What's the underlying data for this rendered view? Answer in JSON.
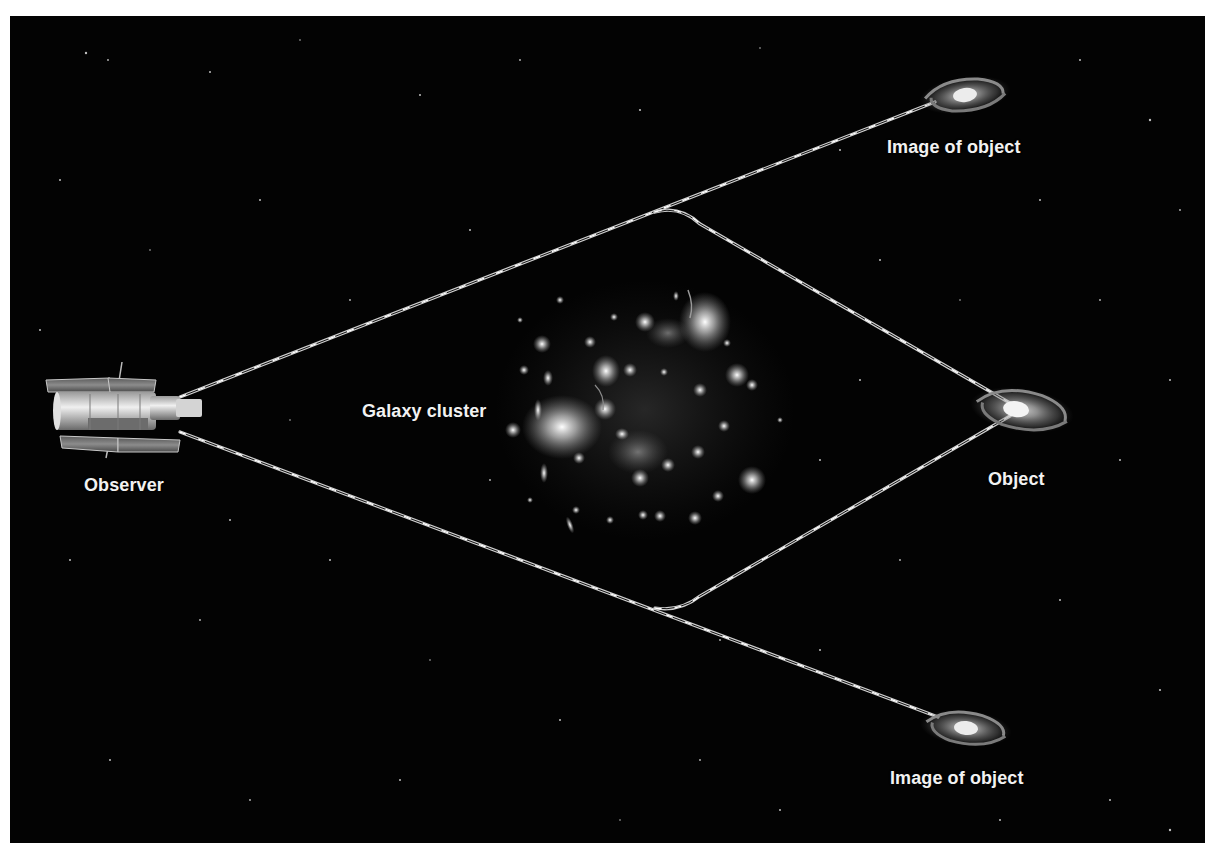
{
  "figure": {
    "background_color": "#030303",
    "line_color": "#e8e8e8",
    "label_color": "#f2f2f2"
  },
  "labels": {
    "observer": "Observer",
    "galaxy_cluster": "Galaxy cluster",
    "object": "Object",
    "image_top": "Image of object",
    "image_bottom": "Image of object"
  },
  "elements": {
    "observer_icon": "space-telescope-icon",
    "cluster_icon": "galaxy-cluster",
    "object_icon": "spiral-galaxy-icon",
    "image_icon": "spiral-galaxy-icon"
  },
  "geometry": {
    "observer": {
      "x": 120,
      "y": 410
    },
    "upper_bend": {
      "x": 655,
      "y": 212
    },
    "lower_bend": {
      "x": 655,
      "y": 608
    },
    "object": {
      "x": 1020,
      "y": 410
    },
    "image_top": {
      "x": 965,
      "y": 95
    },
    "image_bottom": {
      "x": 965,
      "y": 728
    },
    "cluster_center": {
      "x": 645,
      "y": 410
    }
  }
}
